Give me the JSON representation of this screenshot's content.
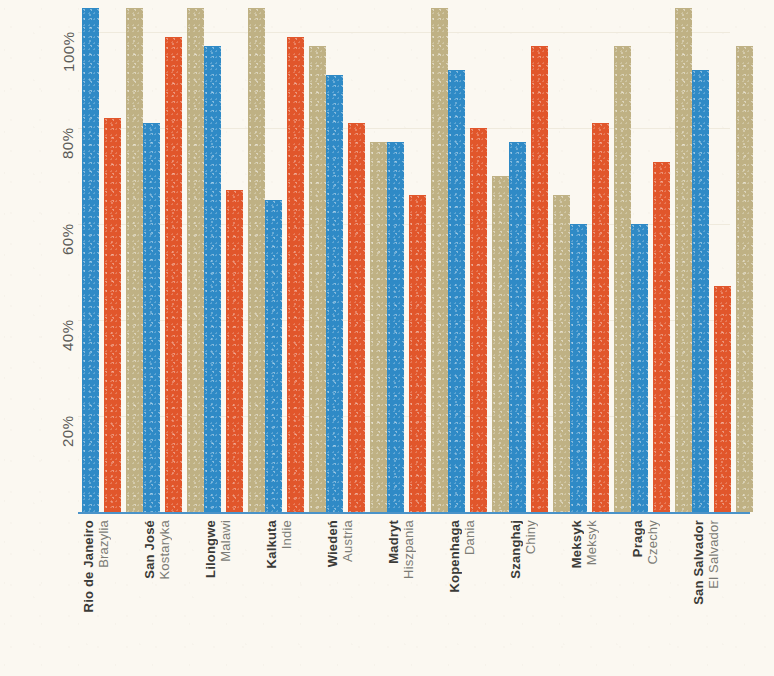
{
  "chart_data": {
    "type": "bar",
    "title": "",
    "subtitle": "",
    "xlabel": "",
    "ylabel": "",
    "ylim": [
      0,
      105
    ],
    "grid": true,
    "legend": "none",
    "y_ticks": [
      "20%",
      "40%",
      "60%",
      "80%",
      "100%"
    ],
    "y_tick_values": [
      20,
      40,
      60,
      80,
      100
    ],
    "categories": [
      "Rio de Janeiro",
      "San José",
      "Lilongwe",
      "Kalkuta",
      "Wiedeń",
      "Madryt",
      "Kopenhaga",
      "Szanghaj",
      "Meksyk",
      "Praga",
      "San Salvador"
    ],
    "category_sublabels": [
      "Brazylia",
      "Kostaryka",
      "Malawi",
      "Indie",
      "Austria",
      "Hiszpania",
      "Dania",
      "Chiny",
      "Meksyk",
      "Czechy",
      "El Salvador"
    ],
    "series": [
      {
        "name": "series-1",
        "color": "#2F8AC6",
        "values": [
          105,
          81,
          97,
          65,
          91,
          77,
          92,
          77,
          60,
          60,
          92
        ]
      },
      {
        "name": "series-2",
        "color": "#E1562B",
        "values": [
          82,
          99,
          67,
          99,
          81,
          66,
          80,
          97,
          81,
          73,
          47
        ]
      },
      {
        "name": "series-3",
        "color": "#BFB184",
        "values": [
          105,
          105,
          105,
          97,
          77,
          105,
          70,
          66,
          97,
          105,
          97
        ]
      }
    ],
    "colors": {
      "background": "#FBF8F1",
      "axis": "#4A93C9",
      "gridline": "#EFEADD",
      "tick_label": "#5B5B57",
      "city_label": "#3B3B38",
      "country_label": "#7C7C76"
    }
  }
}
